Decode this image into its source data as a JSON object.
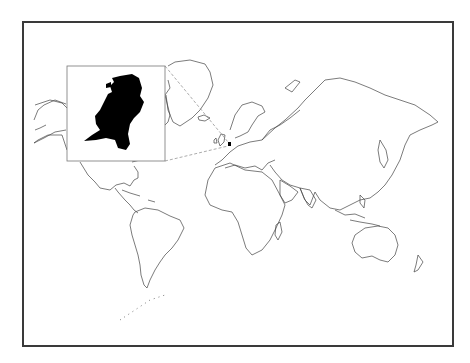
{
  "map": {
    "title": "World map highlighting the Netherlands",
    "projection": "mercator",
    "highlighted_country": "Netherlands",
    "colors": {
      "frame": "#3a3a3a",
      "coastline": "#444444",
      "highlight": "#000000",
      "leader_line": "#888888",
      "background": "#ffffff"
    },
    "inset": {
      "label": "Netherlands",
      "x": 67,
      "y": 66,
      "width": 98,
      "height": 95
    }
  }
}
